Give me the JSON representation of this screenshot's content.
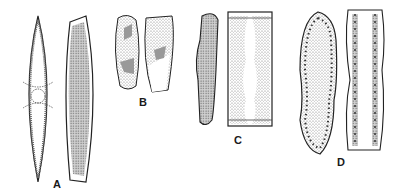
{
  "figure": {
    "panels": [
      {
        "label": "A",
        "description": "two lanceolate diatom cells: valve view with central area and girdle view, stippled"
      },
      {
        "label": "B",
        "description": "two small oblong cells with patchy chloroplasts"
      },
      {
        "label": "C",
        "description": "narrow undulate cell and rectangular girdle view with wavy chloroplast margins"
      },
      {
        "label": "D",
        "description": "broad constricted cell with marginal costae and undulate girdle view with stippled bands"
      }
    ],
    "colors": {
      "ink": "#222222",
      "stipple": "#8a8a8a",
      "background": "#ffffff"
    }
  }
}
